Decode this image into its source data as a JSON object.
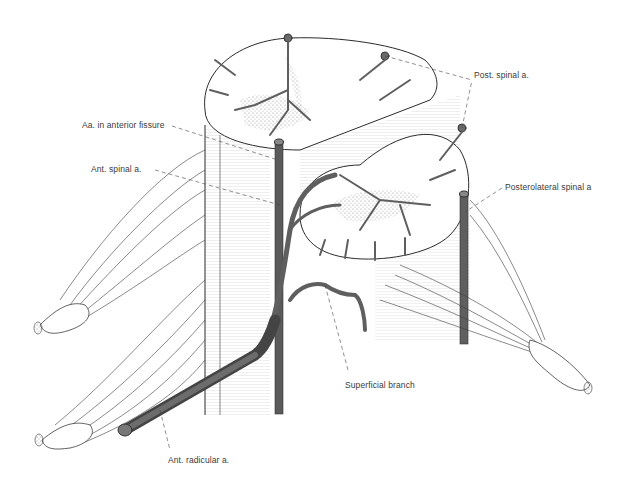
{
  "figure": {
    "colors": {
      "artery": "#5f5f5f",
      "artery_dark": "#3e3e3e",
      "line": "#2b2b2b",
      "stipple": "#9a9a9a",
      "background": "#ffffff"
    },
    "labels": [
      {
        "id": "post-spinal",
        "text": "Post. spinal a.",
        "x": 474,
        "y": 70
      },
      {
        "id": "aa-anterior-fissure",
        "text": "Aa. in anterior fissure",
        "x": 82,
        "y": 120
      },
      {
        "id": "ant-spinal",
        "text": "Ant. spinal a.",
        "x": 91,
        "y": 164
      },
      {
        "id": "posterolateral-spinal",
        "text": "Posterolateral spinal a",
        "x": 505,
        "y": 182
      },
      {
        "id": "superficial-branch",
        "text": "Superficial branch",
        "x": 345,
        "y": 380
      },
      {
        "id": "ant-radicular",
        "text": "Ant. radicular a.",
        "x": 168,
        "y": 455
      }
    ]
  }
}
